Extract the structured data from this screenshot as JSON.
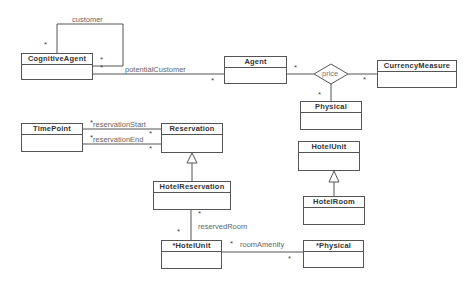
{
  "diagram": {
    "type": "uml-class-diagram",
    "classes": [
      {
        "id": "cognitive-agent",
        "name": "CognitiveAgent"
      },
      {
        "id": "agent",
        "name": "Agent"
      },
      {
        "id": "currency-measure",
        "name": "CurrencyMeasure"
      },
      {
        "id": "physical-top",
        "name": "Physical"
      },
      {
        "id": "time-point",
        "name": "TimePoint"
      },
      {
        "id": "reservation",
        "name": "Reservation"
      },
      {
        "id": "hotel-unit-right",
        "name": "HotelUnit"
      },
      {
        "id": "hotel-reservation",
        "name": "HotelReservation"
      },
      {
        "id": "hotel-room",
        "name": "HotelRoom"
      },
      {
        "id": "hotel-unit-bottom",
        "name": "*HotelUnit"
      },
      {
        "id": "physical-bottom",
        "name": "*Physical"
      }
    ],
    "associations": [
      {
        "id": "customer",
        "label": "customer",
        "from": "CognitiveAgent",
        "to": "CognitiveAgent",
        "mult_from": "*",
        "mult_to": "*"
      },
      {
        "id": "potential-customer",
        "label": "potentialCustomer",
        "from": "CognitiveAgent",
        "to": "Agent",
        "mult_from": "*",
        "mult_to": "*"
      },
      {
        "id": "price",
        "label": "price",
        "kind": "n-ary",
        "members": [
          "Agent",
          "CurrencyMeasure",
          "Physical"
        ],
        "mult": [
          "*",
          "*",
          "*"
        ]
      },
      {
        "id": "reservation-start",
        "label": "reservationStart",
        "from": "TimePoint",
        "to": "Reservation",
        "mult_from": "*",
        "mult_to": "*"
      },
      {
        "id": "reservation-end",
        "label": "reservationEnd",
        "from": "TimePoint",
        "to": "Reservation",
        "mult_from": "*",
        "mult_to": "*"
      },
      {
        "id": "reserved-room",
        "label": "reservedRoom",
        "from": "HotelReservation",
        "to": "*HotelUnit",
        "mult_from": "*",
        "mult_to": "*"
      },
      {
        "id": "room-amenity",
        "label": "roomAmenity",
        "from": "*HotelUnit",
        "to": "*Physical",
        "mult_from": "*",
        "mult_to": "*"
      }
    ],
    "generalizations": [
      {
        "child": "HotelReservation",
        "parent": "Reservation"
      },
      {
        "child": "HotelRoom",
        "parent": "HotelUnit"
      }
    ],
    "multiplicity_symbol": "*",
    "colors": {
      "line": "#555555",
      "text": "#333333",
      "label": "#666666",
      "background": "#ffffff"
    }
  }
}
